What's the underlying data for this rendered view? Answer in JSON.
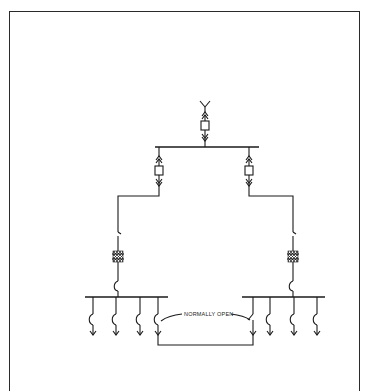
{
  "diagram": {
    "type": "one-line electrical single-line diagram",
    "labels": {
      "tie_label": "NORMALLY OPEN"
    },
    "components": {
      "incoming_source": {
        "symbol": "Y-terminal / source"
      },
      "main_breaker": {
        "symbol": "drawout breaker (box with up/down arrow disconnects)"
      },
      "main_bus": {
        "symbol": "horizontal bus"
      },
      "branch_breakers": [
        {
          "side": "left",
          "symbol": "drawout breaker"
        },
        {
          "side": "right",
          "symbol": "drawout breaker"
        }
      ],
      "branches": [
        {
          "side": "left",
          "elements": [
            "switch",
            "transformer (hatched)",
            "breaker arc"
          ]
        },
        {
          "side": "right",
          "elements": [
            "switch",
            "transformer (hatched)",
            "breaker arc"
          ]
        }
      ],
      "load_buses": [
        {
          "side": "left",
          "feeder_count": 4
        },
        {
          "side": "right",
          "feeder_count": 4
        }
      ],
      "tie": {
        "state": "normally open",
        "connects": [
          "left load bus feeder 4",
          "right load bus feeder 1"
        ]
      }
    }
  }
}
